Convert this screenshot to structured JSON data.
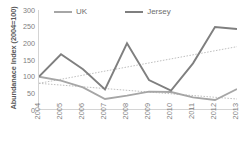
{
  "chart_data": {
    "type": "line",
    "title": "",
    "xlabel": "",
    "ylabel": "Abundanace Index (2004=100)",
    "categories": [
      "2004",
      "2005",
      "2006",
      "2007",
      "2008",
      "2009",
      "2010",
      "2011",
      "2012",
      "2013"
    ],
    "ylim": [
      0,
      300
    ],
    "yticks": [
      300,
      250,
      200,
      150,
      100,
      50,
      0
    ],
    "grid": false,
    "legend_position": "top",
    "series": [
      {
        "name": "UK",
        "color": "#a6a6a6",
        "values": [
          100,
          88,
          68,
          33,
          43,
          55,
          54,
          38,
          30,
          63
        ],
        "trendline": {
          "type": "linear",
          "style": "dotted",
          "color": "#bfbfbf",
          "start": 80,
          "end": 33
        }
      },
      {
        "name": "Jersey",
        "color": "#7f7f7f",
        "values": [
          100,
          167,
          122,
          62,
          200,
          90,
          58,
          140,
          249,
          243
        ],
        "trendline": {
          "type": "linear",
          "style": "dotted",
          "color": "#bfbfbf",
          "start": 80,
          "end": 190
        }
      }
    ]
  },
  "legend": {
    "items": [
      {
        "label": "UK",
        "color": "#a6a6a6"
      },
      {
        "label": "Jersey",
        "color": "#7f7f7f"
      }
    ]
  }
}
